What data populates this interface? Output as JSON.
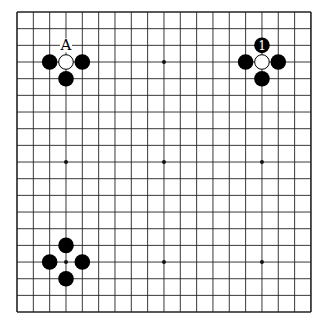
{
  "board": {
    "size": 19,
    "origin_x": 17,
    "origin_y": 12,
    "step_x": 16.33,
    "step_y": 16.67,
    "line_color": "#222222",
    "stone_radius": 7.8,
    "hoshi": [
      [
        3,
        3
      ],
      [
        9,
        3
      ],
      [
        15,
        3
      ],
      [
        3,
        9
      ],
      [
        9,
        9
      ],
      [
        15,
        9
      ],
      [
        3,
        15
      ],
      [
        9,
        15
      ],
      [
        15,
        15
      ]
    ]
  },
  "stones": [
    {
      "color": "white",
      "col": 3,
      "row": 3
    },
    {
      "color": "black",
      "col": 2,
      "row": 3
    },
    {
      "color": "black",
      "col": 4,
      "row": 3
    },
    {
      "color": "black",
      "col": 3,
      "row": 4
    },
    {
      "color": "white",
      "col": 15,
      "row": 3
    },
    {
      "color": "black",
      "col": 15,
      "row": 2,
      "label": "1"
    },
    {
      "color": "black",
      "col": 14,
      "row": 3
    },
    {
      "color": "black",
      "col": 16,
      "row": 3
    },
    {
      "color": "black",
      "col": 15,
      "row": 4
    },
    {
      "color": "black",
      "col": 3,
      "row": 14
    },
    {
      "color": "black",
      "col": 2,
      "row": 15
    },
    {
      "color": "black",
      "col": 4,
      "row": 15
    },
    {
      "color": "black",
      "col": 3,
      "row": 16
    }
  ],
  "labels": [
    {
      "text": "A",
      "col": 3,
      "row": 2
    }
  ]
}
